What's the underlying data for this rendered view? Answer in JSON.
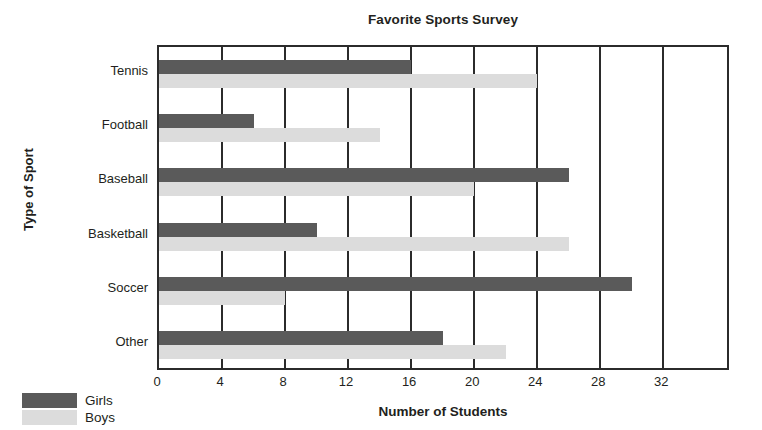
{
  "chart_data": {
    "type": "bar",
    "orientation": "horizontal",
    "title": "Favorite Sports Survey",
    "xlabel": "Number of Students",
    "ylabel": "Type of Sport",
    "categories": [
      "Tennis",
      "Football",
      "Baseball",
      "Basketball",
      "Soccer",
      "Other"
    ],
    "series": [
      {
        "name": "Girls",
        "color": "#5a5a5a",
        "values": [
          16,
          6,
          26,
          10,
          30,
          18
        ]
      },
      {
        "name": "Boys",
        "color": "#dcdcdc",
        "values": [
          24,
          14,
          20,
          26,
          8,
          22
        ]
      }
    ],
    "xlim": [
      0,
      36.3
    ],
    "xticks": [
      0,
      4,
      8,
      12,
      16,
      20,
      24,
      28,
      32
    ],
    "xtick_labels": [
      "0",
      "4",
      "8",
      "12",
      "16",
      "20",
      "24",
      "28",
      "32"
    ],
    "grid": "vertical",
    "legend_position": "bottom-left"
  },
  "legend": {
    "items": [
      {
        "label": "Girls",
        "color": "#5a5a5a"
      },
      {
        "label": "Boys",
        "color": "#dcdcdc"
      }
    ]
  }
}
